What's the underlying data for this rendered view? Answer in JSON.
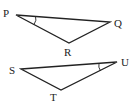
{
  "diagram": {
    "type": "geometry-triangles",
    "triangles": [
      {
        "name": "PQR",
        "vertices": [
          {
            "label": "P",
            "x": 16,
            "y": 15,
            "label_x": 3,
            "label_y": 17
          },
          {
            "label": "Q",
            "x": 110,
            "y": 22,
            "label_x": 114,
            "label_y": 27
          },
          {
            "label": "R",
            "x": 69,
            "y": 43,
            "label_x": 64,
            "label_y": 56
          }
        ],
        "marked_angle": "P"
      },
      {
        "name": "STU",
        "vertices": [
          {
            "label": "S",
            "x": 21,
            "y": 69,
            "label_x": 9,
            "label_y": 74
          },
          {
            "label": "T",
            "x": 61,
            "y": 90,
            "label_x": 50,
            "label_y": 102
          },
          {
            "label": "U",
            "x": 117,
            "y": 62,
            "label_x": 121,
            "label_y": 66
          }
        ],
        "marked_angle": "U"
      }
    ],
    "colors": {
      "stroke": "#222222",
      "background": "#ffffff"
    }
  }
}
